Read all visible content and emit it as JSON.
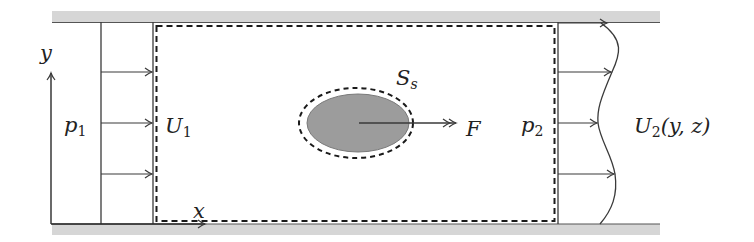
{
  "diagram": {
    "colors": {
      "wall": "#d4d4d4",
      "line": "#3a3a3a",
      "body_fill": "#9a9a9a",
      "dashed": "#1a1a1a"
    },
    "labels": {
      "y_axis": "y",
      "x_axis": "x",
      "p1_main": "p",
      "p1_sub": "1",
      "u1_main": "U",
      "u1_sub": "1",
      "ss_main": "S",
      "ss_sub": "s",
      "force": "F",
      "p2_main": "p",
      "p2_sub": "2",
      "u2_main": "U",
      "u2_sub": "2",
      "u2_args": "(y, z)"
    },
    "elements": [
      "top-wall",
      "bottom-wall",
      "inlet-uniform-profile",
      "control-volume-dashed",
      "body-ellipse",
      "body-control-surface",
      "force-arrow",
      "outlet-nonuniform-profile",
      "coordinate-axes"
    ]
  }
}
